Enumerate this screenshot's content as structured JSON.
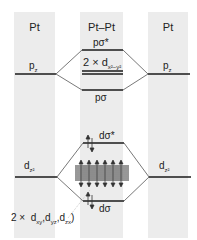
{
  "columns": [
    {
      "title": "Pt"
    },
    {
      "title": "Pt–Pt"
    },
    {
      "title": "Pt"
    }
  ],
  "levels": {
    "left_pz": {
      "label": "p",
      "sub": "z"
    },
    "right_pz": {
      "label": "p",
      "sub": "z"
    },
    "p_sigma_star": {
      "label": "pσ*"
    },
    "d_x2y2": {
      "label": "2 × d",
      "sub": "x²−y²"
    },
    "p_sigma": {
      "label": "pσ"
    },
    "left_dz2": {
      "label": "d",
      "sub": "z²"
    },
    "right_dz2": {
      "label": "d",
      "sub": "z²"
    },
    "d_sigma_star": {
      "label": "dσ*"
    },
    "d_sigma": {
      "label": "dσ"
    },
    "d_band": {
      "prefix": "2 ×",
      "d1": "d",
      "s1": "xy",
      "sep1": ",",
      "d2": "d",
      "s2": "yz",
      "sep2": ",",
      "d3": "d",
      "s3": "zx",
      "close": ")"
    }
  },
  "colors": {
    "column_bg": "#ececec",
    "line": "#1a1a1a",
    "connector": "#555555"
  }
}
